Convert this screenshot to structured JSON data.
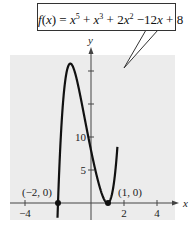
{
  "chart_data": {
    "type": "line",
    "function": "x^5 + x^3 + 2x^2 - 12x + 8",
    "xlabel": "x",
    "ylabel": "y",
    "xlim": [
      -5,
      5
    ],
    "ylim": [
      -2,
      23
    ],
    "xticks": [
      -4,
      2,
      4
    ],
    "yticks": [
      5,
      10
    ],
    "grid": false,
    "background": "#ececec",
    "curve_color": "#111111",
    "points": [
      {
        "x": -2,
        "y": 0,
        "label": "(-2, 0)"
      },
      {
        "x": 1,
        "y": 0,
        "label": "(1, 0)"
      }
    ],
    "local_max": {
      "x": -1.1,
      "y": 21.1
    },
    "local_min": {
      "x": 1,
      "y": 0
    }
  },
  "callout": {
    "f": "f",
    "x_arg": "x",
    "eq": ") = ",
    "t1": "x",
    "e1": "5",
    "p1": " + ",
    "t2": "x",
    "e2": "3",
    "p2": " + 2",
    "t3": "x",
    "e3": "2",
    "p3": " −12",
    "t4": "x",
    "p4": " + 8"
  },
  "axes": {
    "x_label": "x",
    "y_label": "y",
    "x_tick_labels": [
      "−4",
      "2",
      "4"
    ],
    "y_tick_labels": [
      "10",
      "5"
    ],
    "point_labels": [
      "(−2, 0)",
      "(1, 0)"
    ]
  }
}
